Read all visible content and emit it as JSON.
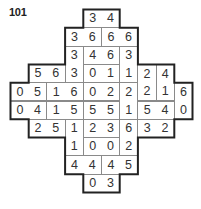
{
  "puzzle": {
    "number": "101",
    "grid": {
      "origin_x": 10,
      "origin_y": 9,
      "cell_w": 18.2,
      "cell_h": 18.3,
      "rows": [
        {
          "start_col": 4,
          "values": [
            "3",
            "4"
          ]
        },
        {
          "start_col": 3,
          "values": [
            "3",
            "6",
            "6",
            "6"
          ]
        },
        {
          "start_col": 3,
          "values": [
            "3",
            "4",
            "6",
            "3"
          ]
        },
        {
          "start_col": 1,
          "values": [
            "5",
            "6",
            "3",
            "0",
            "1",
            "1",
            "2",
            "4"
          ]
        },
        {
          "start_col": 0,
          "values": [
            "0",
            "5",
            "1",
            "6",
            "0",
            "2",
            "2",
            "2",
            "1",
            "6"
          ]
        },
        {
          "start_col": 0,
          "values": [
            "0",
            "4",
            "1",
            "5",
            "5",
            "5",
            "1",
            "5",
            "4",
            "0"
          ]
        },
        {
          "start_col": 1,
          "values": [
            "2",
            "5",
            "1",
            "2",
            "3",
            "6",
            "3",
            "2"
          ]
        },
        {
          "start_col": 3,
          "values": [
            "1",
            "0",
            "0",
            "2"
          ]
        },
        {
          "start_col": 3,
          "values": [
            "4",
            "4",
            "4",
            "5"
          ]
        },
        {
          "start_col": 4,
          "values": [
            "0",
            "3"
          ]
        }
      ]
    },
    "dominoes": [
      {
        "r": 0,
        "c": 4,
        "dir": "h",
        "a": "3",
        "b": "4"
      },
      {
        "r": 1,
        "c": 3,
        "dir": "h",
        "a": "3",
        "b": "6"
      },
      {
        "r": 1,
        "c": 5,
        "dir": "h",
        "a": "6",
        "b": "6"
      },
      {
        "r": 2,
        "c": 3,
        "dir": "v",
        "a": "3",
        "b": "3"
      },
      {
        "r": 2,
        "c": 4,
        "dir": "h",
        "a": "4",
        "b": "6"
      },
      {
        "r": 2,
        "c": 6,
        "dir": "v",
        "a": "3",
        "b": "1"
      },
      {
        "r": 3,
        "c": 1,
        "dir": "h",
        "a": "5",
        "b": "6"
      },
      {
        "r": 3,
        "c": 4,
        "dir": "h",
        "a": "0",
        "b": "1"
      },
      {
        "r": 3,
        "c": 7,
        "dir": "v",
        "a": "2",
        "b": "2"
      },
      {
        "r": 3,
        "c": 8,
        "dir": "v",
        "a": "4",
        "b": "1"
      },
      {
        "r": 4,
        "c": 0,
        "dir": "h",
        "a": "0",
        "b": "5"
      },
      {
        "r": 4,
        "c": 2,
        "dir": "h",
        "a": "1",
        "b": "6"
      },
      {
        "r": 4,
        "c": 4,
        "dir": "h",
        "a": "0",
        "b": "2"
      },
      {
        "r": 4,
        "c": 6,
        "dir": "v",
        "a": "2",
        "b": "1"
      },
      {
        "r": 4,
        "c": 9,
        "dir": "v",
        "a": "6",
        "b": "0"
      },
      {
        "r": 5,
        "c": 0,
        "dir": "h",
        "a": "0",
        "b": "4"
      },
      {
        "r": 5,
        "c": 2,
        "dir": "h",
        "a": "1",
        "b": "5"
      },
      {
        "r": 5,
        "c": 4,
        "dir": "h",
        "a": "5",
        "b": "5"
      },
      {
        "r": 5,
        "c": 7,
        "dir": "h",
        "a": "5",
        "b": "4"
      },
      {
        "r": 6,
        "c": 1,
        "dir": "h",
        "a": "2",
        "b": "5"
      },
      {
        "r": 6,
        "c": 3,
        "dir": "v",
        "a": "1",
        "b": "1"
      },
      {
        "r": 6,
        "c": 4,
        "dir": "h",
        "a": "2",
        "b": "3"
      },
      {
        "r": 6,
        "c": 6,
        "dir": "v",
        "a": "6",
        "b": "2"
      },
      {
        "r": 6,
        "c": 7,
        "dir": "h",
        "a": "3",
        "b": "2"
      },
      {
        "r": 7,
        "c": 4,
        "dir": "h",
        "a": "0",
        "b": "0"
      },
      {
        "r": 8,
        "c": 3,
        "dir": "h",
        "a": "4",
        "b": "4"
      },
      {
        "r": 8,
        "c": 5,
        "dir": "h",
        "a": "4",
        "b": "5"
      },
      {
        "r": 9,
        "c": 4,
        "dir": "h",
        "a": "0",
        "b": "3"
      }
    ],
    "outline": [
      [
        4,
        0
      ],
      [
        6,
        0
      ],
      [
        6,
        1
      ],
      [
        7,
        1
      ],
      [
        7,
        3
      ],
      [
        9,
        3
      ],
      [
        9,
        4
      ],
      [
        10,
        4
      ],
      [
        10,
        6
      ],
      [
        9,
        6
      ],
      [
        9,
        7
      ],
      [
        7,
        7
      ],
      [
        7,
        9
      ],
      [
        6,
        9
      ],
      [
        6,
        10
      ],
      [
        4,
        10
      ],
      [
        4,
        9
      ],
      [
        3,
        9
      ],
      [
        3,
        7
      ],
      [
        1,
        7
      ],
      [
        1,
        6
      ],
      [
        0,
        6
      ],
      [
        0,
        4
      ],
      [
        1,
        4
      ],
      [
        1,
        3
      ],
      [
        3,
        3
      ],
      [
        3,
        1
      ],
      [
        4,
        1
      ]
    ],
    "colors": {
      "outline": "#222222",
      "inner": "#8a8a8a",
      "text": "#333333"
    }
  }
}
